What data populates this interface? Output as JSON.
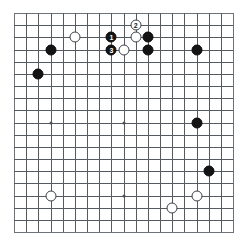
{
  "diagram": {
    "board_size": 19,
    "colors": {
      "background": "#ffffff",
      "grid_line": "#555a60",
      "board_edge": "#6d7278",
      "black_stone": "#141414",
      "white_stone": "#ffffff",
      "star_point": "#4a4f55"
    },
    "geometry": {
      "left": 14,
      "top": 13,
      "spacing": 12.17,
      "stone_diameter": 11
    }
  },
  "star_points": [
    {
      "col": 3,
      "row": 3
    },
    {
      "col": 9,
      "row": 3
    },
    {
      "col": 15,
      "row": 3
    },
    {
      "col": 3,
      "row": 9
    },
    {
      "col": 9,
      "row": 9
    },
    {
      "col": 15,
      "row": 9
    },
    {
      "col": 3,
      "row": 15
    },
    {
      "col": 9,
      "row": 15
    },
    {
      "col": 15,
      "row": 15
    }
  ],
  "stones": [
    {
      "color": "white",
      "col": 5,
      "row": 2,
      "label": ""
    },
    {
      "color": "black",
      "col": 3,
      "row": 3,
      "label": ""
    },
    {
      "color": "black",
      "col": 2,
      "row": 5,
      "label": ""
    },
    {
      "color": "black",
      "col": 8,
      "row": 2,
      "label": "1"
    },
    {
      "color": "white",
      "col": 10,
      "row": 1,
      "label": "2"
    },
    {
      "color": "white",
      "col": 10,
      "row": 2,
      "label": ""
    },
    {
      "color": "black",
      "col": 11,
      "row": 2,
      "label": ""
    },
    {
      "color": "black",
      "col": 8,
      "row": 3,
      "label": "3"
    },
    {
      "color": "white",
      "col": 9,
      "row": 3,
      "label": ""
    },
    {
      "color": "black",
      "col": 11,
      "row": 3,
      "label": ""
    },
    {
      "color": "black",
      "col": 15,
      "row": 3,
      "label": ""
    },
    {
      "color": "black",
      "col": 15,
      "row": 9,
      "label": ""
    },
    {
      "color": "black",
      "col": 16,
      "row": 13,
      "label": ""
    },
    {
      "color": "white",
      "col": 3,
      "row": 15,
      "label": ""
    },
    {
      "color": "white",
      "col": 15,
      "row": 15,
      "label": ""
    },
    {
      "color": "white",
      "col": 13,
      "row": 16,
      "label": ""
    }
  ]
}
